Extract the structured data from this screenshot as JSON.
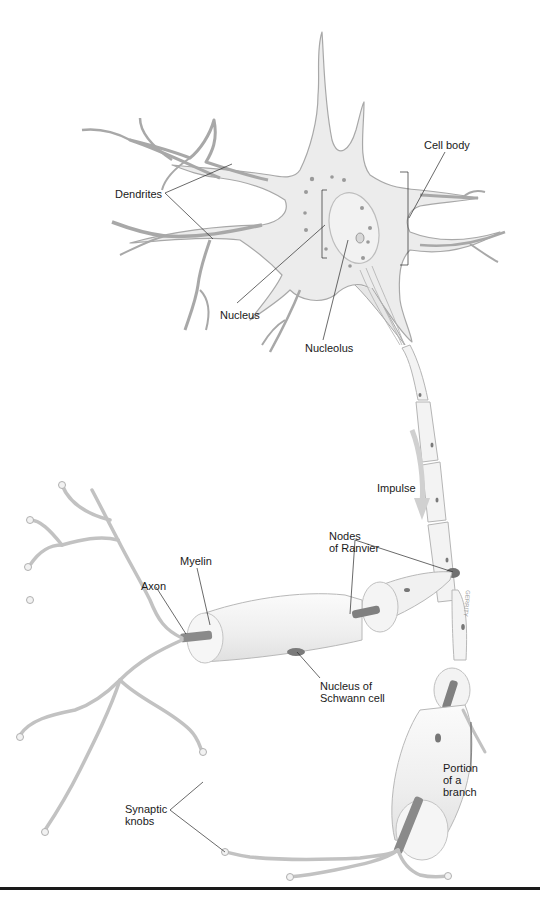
{
  "figure": {
    "colors": {
      "cell_fill": "#ececec",
      "cell_stroke": "#a8a8a8",
      "myelin_fill": "#f4f4f4",
      "axon_core": "#8a8a8a",
      "nucleus_dot": "#6e6e6e",
      "leader_line": "#2a2a2a",
      "rule": "#1a1a1a"
    }
  },
  "labels": {
    "dendrites": "Dendrites",
    "cell_body": "Cell body",
    "nucleus": "Nucleus",
    "nucleolus": "Nucleolus",
    "impulse": "Impulse",
    "nodes_of_ranvier": "Nodes\nof Ranvier",
    "myelin": "Myelin",
    "axon": "Axon",
    "nucleus_of_schwann_cell": "Nucleus of\nSchwann cell",
    "portion_of_a_branch": "Portion\nof a\nbranch",
    "synaptic_knobs": "Synaptic\nknobs"
  },
  "signature": "GERRITY"
}
